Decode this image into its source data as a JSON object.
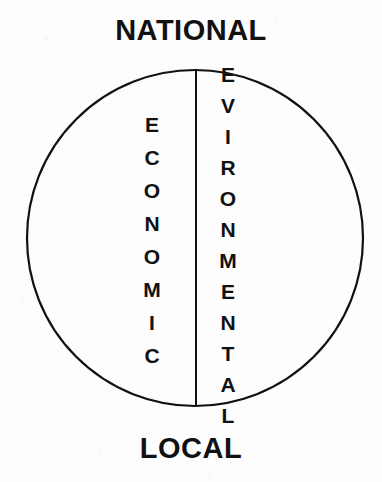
{
  "figure": {
    "type": "venn-like-divided-circle",
    "background_color": "#fdfdfd",
    "ink_color": "#111111"
  },
  "poles": {
    "top_label": "NATIONAL",
    "bottom_label": "LOCAL"
  },
  "halves": {
    "left": {
      "word": "ECONOMIC",
      "letters": [
        "E",
        "C",
        "O",
        "N",
        "O",
        "M",
        "I",
        "C"
      ]
    },
    "right": {
      "word": "EVIRONMENTAL",
      "letters": [
        "E",
        "V",
        "I",
        "R",
        "O",
        "N",
        "M",
        "E",
        "N",
        "T",
        "A",
        "L"
      ]
    }
  },
  "geometry": {
    "circle_center_x": 195,
    "circle_center_y": 238,
    "circle_radius": 168,
    "stroke_width": 2,
    "divider_x": 196,
    "divider_top_y": 70,
    "divider_bottom_y": 406
  }
}
